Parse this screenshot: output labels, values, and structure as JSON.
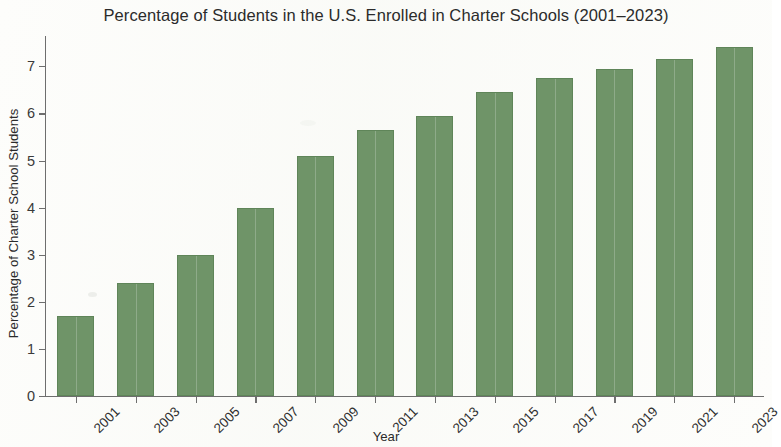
{
  "chart_data": {
    "type": "bar",
    "title": "Percentage of Students in the U.S. Enrolled in Charter Schools (2001–2023)",
    "xlabel": "Year",
    "ylabel": "Percentage of Charter School Students",
    "categories": [
      "2001",
      "2003",
      "2005",
      "2007",
      "2009",
      "2011",
      "2013",
      "2015",
      "2017",
      "2019",
      "2021",
      "2023"
    ],
    "values": [
      1.7,
      2.4,
      3.0,
      4.0,
      5.1,
      5.65,
      5.95,
      6.45,
      6.75,
      6.95,
      7.15,
      7.4
    ],
    "ylim": [
      0,
      7.6
    ],
    "y_ticks": [
      "0",
      "1",
      "2",
      "3",
      "4",
      "5",
      "6",
      "7"
    ],
    "y_tick_values": [
      0,
      1,
      2,
      3,
      4,
      5,
      6,
      7
    ],
    "grid": false,
    "legend": "none",
    "bar_color": "#6f9468",
    "axis_color": "#6e6e6e",
    "text_color": "#2b2b2b",
    "background_color": "#fdfdfb",
    "xtick_rotation": "-45"
  }
}
